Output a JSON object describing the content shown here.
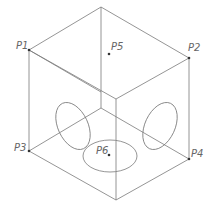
{
  "diagram": {
    "type": "isometric-cube-wireframe",
    "colors": {
      "line": "#7a7a7a",
      "point": "#333333",
      "label": "#666666"
    },
    "points": [
      {
        "id": "P1",
        "label": "P1",
        "x": 29,
        "y": 50
      },
      {
        "id": "P2",
        "label": "P2",
        "x": 189,
        "y": 58
      },
      {
        "id": "P3",
        "label": "P3",
        "x": 29,
        "y": 151
      },
      {
        "id": "P4",
        "label": "P4",
        "x": 189,
        "y": 159
      },
      {
        "id": "P5",
        "label": "P5",
        "x": 109,
        "y": 54
      },
      {
        "id": "P6",
        "label": "P6",
        "x": 109,
        "y": 155
      }
    ],
    "labels": {
      "p1": "P1",
      "p2": "P2",
      "p3": "P3",
      "p4": "P4",
      "p5": "P5",
      "p6": "P6"
    },
    "vertices": {
      "top": [
        101,
        7
      ],
      "p1": [
        29,
        50
      ],
      "p2": [
        189,
        58
      ],
      "front_top": [
        116,
        99
      ],
      "back_bottom": [
        101,
        108
      ],
      "p3": [
        29,
        151
      ],
      "p4": [
        189,
        159
      ],
      "bottom": [
        116,
        200
      ]
    },
    "ellipses": [
      {
        "name": "left-face-circle",
        "cx": 73,
        "cy": 126,
        "rx": 15,
        "ry": 25,
        "rotate": -25
      },
      {
        "name": "right-face-circle",
        "cx": 160,
        "cy": 126,
        "rx": 15,
        "ry": 25,
        "rotate": 25
      },
      {
        "name": "bottom-face-circle",
        "cx": 110,
        "cy": 156,
        "rx": 27,
        "ry": 16,
        "rotate": 0
      }
    ]
  }
}
